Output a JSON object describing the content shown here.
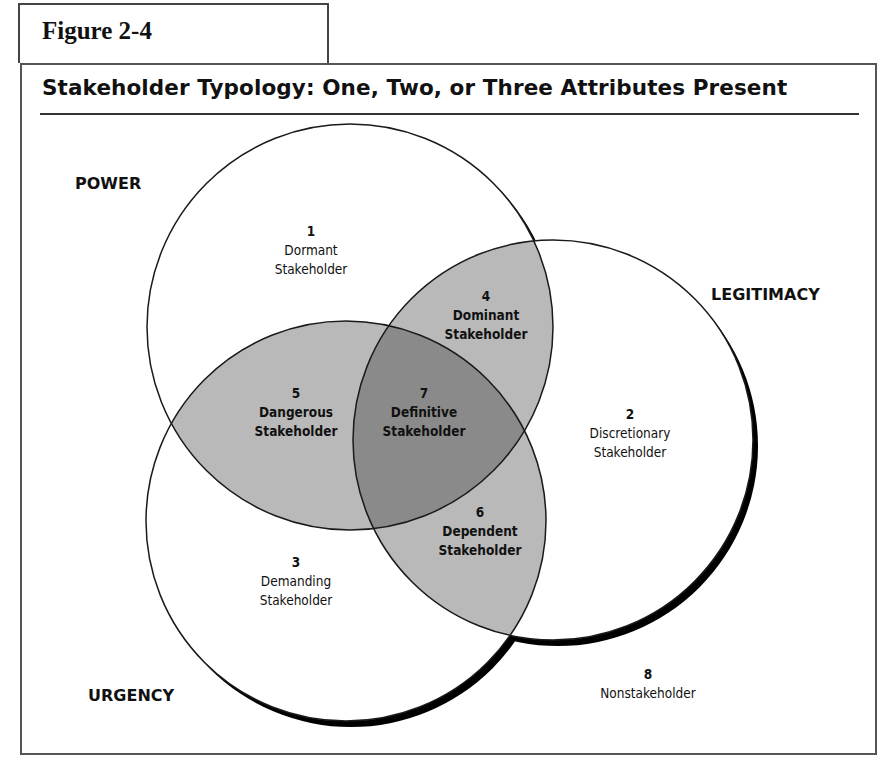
{
  "figure": {
    "label": "Figure 2-4",
    "title": "Stakeholder Typology: One, Two, or Three Attributes Present"
  },
  "sets": {
    "power": "POWER",
    "legitimacy": "LEGITIMACY",
    "urgency": "URGENCY"
  },
  "regions": [
    {
      "number": "1",
      "line1": "Dormant",
      "line2": "Stakeholder",
      "attributes": [
        "Power"
      ]
    },
    {
      "number": "2",
      "line1": "Discretionary",
      "line2": "Stakeholder",
      "attributes": [
        "Legitimacy"
      ]
    },
    {
      "number": "3",
      "line1": "Demanding",
      "line2": "Stakeholder",
      "attributes": [
        "Urgency"
      ]
    },
    {
      "number": "4",
      "line1": "Dominant",
      "line2": "Stakeholder",
      "attributes": [
        "Power",
        "Legitimacy"
      ]
    },
    {
      "number": "5",
      "line1": "Dangerous",
      "line2": "Stakeholder",
      "attributes": [
        "Power",
        "Urgency"
      ]
    },
    {
      "number": "6",
      "line1": "Dependent",
      "line2": "Stakeholder",
      "attributes": [
        "Legitimacy",
        "Urgency"
      ]
    },
    {
      "number": "7",
      "line1": "Definitive",
      "line2": "Stakeholder",
      "attributes": [
        "Power",
        "Legitimacy",
        "Urgency"
      ]
    },
    {
      "number": "8",
      "line1": "Nonstakeholder",
      "line2": "",
      "attributes": []
    }
  ],
  "colors": {
    "two_attr_fill": "#b9b9b9",
    "three_attr_fill": "#8a8a8a",
    "outline": "#1a1a1a"
  }
}
